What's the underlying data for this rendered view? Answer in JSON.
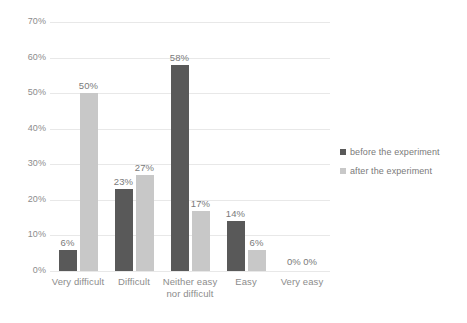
{
  "chart_data": {
    "type": "bar",
    "title": "",
    "subtitle": "",
    "xlabel": "",
    "ylabel": "",
    "categories": [
      "Very difficult",
      "Difficult",
      "Neither easy\nnor difficult",
      "Easy",
      "Very easy"
    ],
    "category_lines": [
      [
        "Very difficult"
      ],
      [
        "Difficult"
      ],
      [
        "Neither easy",
        "nor difficult"
      ],
      [
        "Easy"
      ],
      [
        "Very easy"
      ]
    ],
    "series": [
      {
        "name": "before the experiment",
        "color": "#595959",
        "values": [
          6,
          23,
          58,
          14,
          0
        ],
        "labels": [
          "6%",
          "23%",
          "58%",
          "14%",
          "0%"
        ]
      },
      {
        "name": "after the experiment",
        "color": "#c8c8c8",
        "values": [
          50,
          27,
          17,
          6,
          0
        ],
        "labels": [
          "50%",
          "27%",
          "17%",
          "6%",
          "0%"
        ]
      }
    ],
    "ylim": [
      0,
      70
    ],
    "ytick_values": [
      0,
      10,
      20,
      30,
      40,
      50,
      60,
      70
    ],
    "ytick_labels": [
      "0%",
      "10%",
      "20%",
      "30%",
      "40%",
      "50%",
      "60%",
      "70%"
    ],
    "grid": true,
    "grid_color": "#e8e8e8",
    "legend_position": "right",
    "zero_pair_label": "0% 0%",
    "background": "#ffffff",
    "text_color": "#7f7f7f"
  },
  "legend": {
    "items": [
      {
        "label": "before the experiment",
        "color": "#595959"
      },
      {
        "label": "after the experiment",
        "color": "#c8c8c8"
      }
    ]
  }
}
